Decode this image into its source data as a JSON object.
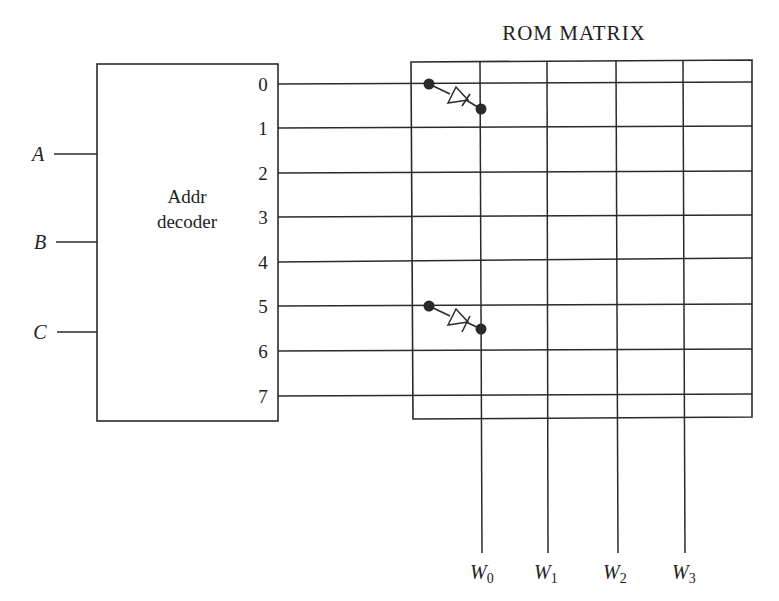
{
  "title": "ROM MATRIX",
  "decoder": {
    "label_line1": "Addr",
    "label_line2": "decoder",
    "inputs": [
      {
        "name": "A",
        "y": 154
      },
      {
        "name": "B",
        "y": 242
      },
      {
        "name": "C",
        "y": 332
      }
    ],
    "outputs": [
      {
        "label": "0",
        "y": 84
      },
      {
        "label": "1",
        "y": 128
      },
      {
        "label": "2",
        "y": 173
      },
      {
        "label": "3",
        "y": 217
      },
      {
        "label": "4",
        "y": 262
      },
      {
        "label": "5",
        "y": 306
      },
      {
        "label": "6",
        "y": 351
      },
      {
        "label": "7",
        "y": 396
      }
    ]
  },
  "matrix": {
    "columns": [
      {
        "label": "W",
        "sub": "0",
        "x": 481
      },
      {
        "label": "W",
        "sub": "1",
        "x": 547
      },
      {
        "label": "W",
        "sub": "2",
        "x": 617
      },
      {
        "label": "W",
        "sub": "3",
        "x": 684
      }
    ],
    "diodes": [
      {
        "row": 0,
        "column": 0
      },
      {
        "row": 5,
        "column": 0
      }
    ]
  },
  "colors": {
    "line": "#2a2a2a",
    "background": "#ffffff"
  }
}
